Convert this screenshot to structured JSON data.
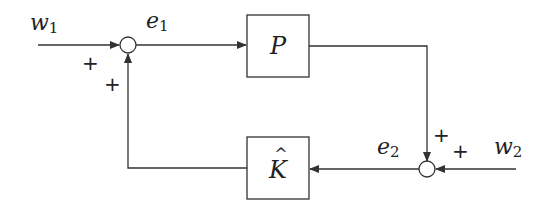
{
  "diagram": {
    "type": "feedback-block-diagram",
    "blocks": [
      {
        "id": "P",
        "label": "P"
      },
      {
        "id": "K",
        "label": "K",
        "hat": "^"
      }
    ],
    "signals": {
      "w1": {
        "base": "w",
        "sub": "1"
      },
      "w2": {
        "base": "w",
        "sub": "2"
      },
      "e1": {
        "base": "e",
        "sub": "1"
      },
      "e2": {
        "base": "e",
        "sub": "2"
      }
    },
    "summers": [
      {
        "id": "sum1",
        "signs": [
          "+",
          "+"
        ]
      },
      {
        "id": "sum2",
        "signs": [
          "+",
          "+"
        ]
      }
    ],
    "colors": {
      "stroke": "#333333",
      "background": "#ffffff"
    }
  }
}
